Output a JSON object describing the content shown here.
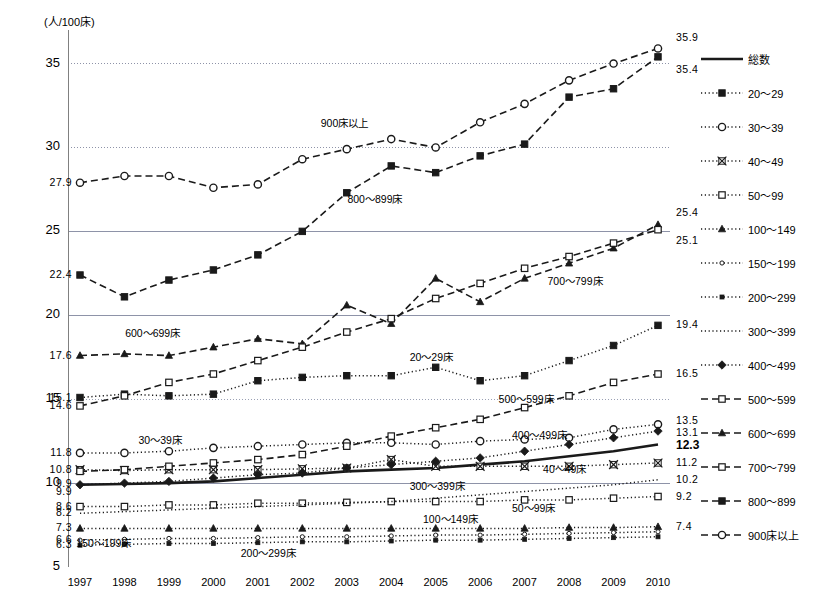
{
  "chart_data": {
    "type": "line",
    "title": "",
    "xlabel": "",
    "ylabel": "(人/100床)",
    "x": [
      "1997",
      "1998",
      "1999",
      "2000",
      "2001",
      "2002",
      "2003",
      "2004",
      "2005",
      "2006",
      "2007",
      "2008",
      "2009",
      "2010"
    ],
    "ylim": [
      5,
      37
    ],
    "yticks": [
      5,
      10,
      15,
      20,
      25,
      30,
      35
    ],
    "grid": true,
    "legend_position": "right",
    "series": [
      {
        "name": "総数",
        "style": "solid-thick",
        "marker": "none",
        "start_label": "9.9",
        "end_label": "12.3",
        "values": [
          9.9,
          9.95,
          10.0,
          10.1,
          10.3,
          10.5,
          10.7,
          10.8,
          10.9,
          11.1,
          11.3,
          11.6,
          11.9,
          12.3
        ]
      },
      {
        "name": "20〜29",
        "style": "dotted",
        "marker": "square",
        "start_label": "15.1",
        "end_label": "19.4",
        "values": [
          15.1,
          15.3,
          15.2,
          15.3,
          16.1,
          16.3,
          16.4,
          16.4,
          16.9,
          16.1,
          16.4,
          17.3,
          18.2,
          19.4
        ]
      },
      {
        "name": "30〜39",
        "style": "dotted",
        "marker": "circle-open",
        "start_label": "11.8",
        "end_label": "13.5",
        "values": [
          11.8,
          11.8,
          11.9,
          12.1,
          12.2,
          12.3,
          12.4,
          12.4,
          12.3,
          12.5,
          12.6,
          12.7,
          13.2,
          13.5
        ]
      },
      {
        "name": "40〜49",
        "style": "dotted",
        "marker": "cross-box",
        "start_label": "10.8",
        "end_label": "11.2",
        "values": [
          10.8,
          10.75,
          10.8,
          10.8,
          10.8,
          10.85,
          10.9,
          11.4,
          11.0,
          11.0,
          11.0,
          11.0,
          11.1,
          11.2
        ]
      },
      {
        "name": "50〜99",
        "style": "dotted",
        "marker": "square-open",
        "start_label": "8.6",
        "end_label": "9.2",
        "values": [
          8.6,
          8.6,
          8.7,
          8.7,
          8.8,
          8.8,
          8.85,
          8.9,
          8.9,
          8.9,
          9.0,
          9.0,
          9.1,
          9.2
        ]
      },
      {
        "name": "100〜149",
        "style": "dotted",
        "marker": "triangle",
        "start_label": "7.3",
        "end_label": "7.4",
        "values": [
          7.3,
          7.3,
          7.3,
          7.3,
          7.3,
          7.3,
          7.3,
          7.3,
          7.3,
          7.3,
          7.3,
          7.35,
          7.35,
          7.4
        ]
      },
      {
        "name": "150〜199",
        "style": "dotted",
        "marker": "circle-small",
        "start_label": "6.6",
        "end_label": "",
        "values": [
          6.6,
          6.65,
          6.7,
          6.7,
          6.75,
          6.8,
          6.8,
          6.85,
          6.9,
          6.9,
          6.95,
          7.0,
          7.05,
          7.1
        ]
      },
      {
        "name": "200〜299",
        "style": "dotted",
        "marker": "square-tiny",
        "start_label": "6.3",
        "end_label": "",
        "values": [
          6.3,
          6.35,
          6.4,
          6.4,
          6.45,
          6.5,
          6.5,
          6.55,
          6.6,
          6.6,
          6.65,
          6.7,
          6.75,
          6.8
        ]
      },
      {
        "name": "300〜399",
        "style": "dotted",
        "marker": "none",
        "start_label": "8.2",
        "end_label": "10.2",
        "values": [
          8.2,
          8.3,
          8.4,
          8.5,
          8.6,
          8.7,
          8.8,
          8.9,
          9.1,
          9.3,
          9.5,
          9.7,
          9.9,
          10.2
        ]
      },
      {
        "name": "400〜499",
        "style": "dotted",
        "marker": "diamond",
        "start_label": "9.9",
        "end_label": "13.1",
        "values": [
          9.9,
          10.0,
          10.1,
          10.3,
          10.5,
          10.6,
          10.9,
          11.1,
          11.3,
          11.5,
          11.9,
          12.3,
          12.7,
          13.1
        ]
      },
      {
        "name": "500〜599",
        "style": "dashed",
        "marker": "square-open",
        "start_label": "14.6",
        "end_label": "16.5",
        "values": [
          10.7,
          10.8,
          11.0,
          11.2,
          11.4,
          11.7,
          12.2,
          12.8,
          13.3,
          13.8,
          14.5,
          15.2,
          16.0,
          16.5
        ]
      },
      {
        "name": "600〜699",
        "style": "dashed",
        "marker": "triangle",
        "start_label": "17.6",
        "end_label": "",
        "values": [
          17.6,
          17.7,
          17.6,
          18.1,
          18.6,
          18.3,
          20.6,
          19.5,
          22.2,
          20.8,
          22.2,
          23.1,
          24.0,
          25.4
        ]
      },
      {
        "name": "700〜799",
        "style": "dashed",
        "marker": "square-open",
        "start_label": "14.6",
        "end_label": "25.1",
        "values": [
          14.6,
          15.2,
          16.0,
          16.5,
          17.3,
          18.1,
          19.0,
          19.8,
          21.0,
          21.9,
          22.8,
          23.5,
          24.3,
          25.1
        ]
      },
      {
        "name": "800〜899",
        "style": "dashed",
        "marker": "square",
        "start_label": "22.4",
        "end_label": "35.4",
        "values": [
          22.4,
          21.1,
          22.1,
          22.7,
          23.6,
          25.0,
          27.3,
          28.9,
          28.5,
          29.5,
          30.2,
          33.0,
          33.5,
          35.4
        ]
      },
      {
        "name": "900床以上",
        "style": "dashed",
        "marker": "circle-open",
        "start_label": "27.9",
        "end_label": "35.9",
        "values": [
          27.9,
          28.3,
          28.3,
          27.6,
          27.8,
          29.3,
          29.9,
          30.5,
          30.0,
          31.5,
          32.6,
          34.0,
          35.0,
          35.9
        ]
      }
    ],
    "left_value_labels": [
      {
        "text": "27.9",
        "value": 27.9
      },
      {
        "text": "22.4",
        "value": 22.4
      },
      {
        "text": "17.6",
        "value": 17.6
      },
      {
        "text": "15.1",
        "value": 15.1
      },
      {
        "text": "14.6",
        "value": 14.6
      },
      {
        "text": "11.8",
        "value": 11.8
      },
      {
        "text": "10.8",
        "value": 10.8
      },
      {
        "text": "9.9",
        "value": 9.95
      },
      {
        "text": "9.9",
        "value": 9.45
      },
      {
        "text": "8.6",
        "value": 8.6
      },
      {
        "text": "8.2",
        "value": 8.2
      },
      {
        "text": "7.3",
        "value": 7.3
      },
      {
        "text": "6.6",
        "value": 6.6
      },
      {
        "text": "6.3",
        "value": 6.3
      }
    ],
    "right_value_labels": [
      {
        "text": "35.9",
        "value": 36.5,
        "bold": false
      },
      {
        "text": "35.4",
        "value": 34.6,
        "bold": false
      },
      {
        "text": "25.4",
        "value": 26.1,
        "bold": false
      },
      {
        "text": "25.1",
        "value": 24.4,
        "bold": false
      },
      {
        "text": "19.4",
        "value": 19.4,
        "bold": false
      },
      {
        "text": "16.5",
        "value": 16.5,
        "bold": false
      },
      {
        "text": "13.5",
        "value": 13.7,
        "bold": false
      },
      {
        "text": "13.1",
        "value": 13.0,
        "bold": false
      },
      {
        "text": "12.3",
        "value": 12.2,
        "bold": true
      },
      {
        "text": "11.2",
        "value": 11.2,
        "bold": false
      },
      {
        "text": "10.2",
        "value": 10.2,
        "bold": false
      },
      {
        "text": "9.2",
        "value": 9.2,
        "bold": false
      },
      {
        "text": "7.4",
        "value": 7.4,
        "bold": false
      }
    ],
    "annotations": [
      {
        "text": "900床以上",
        "x": 2003,
        "value": 31.5
      },
      {
        "text": "800〜899床",
        "x": 2003.6,
        "value": 27.0
      },
      {
        "text": "700〜799床",
        "x": 2008.1,
        "value": 22.1
      },
      {
        "text": "600〜699床",
        "x": 1998.6,
        "value": 19.0
      },
      {
        "text": "500〜599床",
        "x": 2007.0,
        "value": 15.1
      },
      {
        "text": "20〜29床",
        "x": 2005.0,
        "value": 17.6
      },
      {
        "text": "400〜499床",
        "x": 2007.3,
        "value": 12.9
      },
      {
        "text": "40〜49床",
        "x": 2008.0,
        "value": 10.9
      },
      {
        "text": "30〜39床",
        "x": 1998.9,
        "value": 12.6
      },
      {
        "text": "300〜399床",
        "x": 2005.0,
        "value": 9.9
      },
      {
        "text": "50〜99床",
        "x": 2007.3,
        "value": 8.6
      },
      {
        "text": "100〜149床",
        "x": 2005.3,
        "value": 7.9
      },
      {
        "text": "150〜199床",
        "x": 1997.5,
        "value": 6.5
      },
      {
        "text": "200〜299床",
        "x": 2001.2,
        "value": 5.9
      }
    ]
  },
  "legend": {
    "items": [
      {
        "label": "総数",
        "style": "solid-thick",
        "marker": "none"
      },
      {
        "label": "20〜29",
        "style": "dotted",
        "marker": "square"
      },
      {
        "label": "30〜39",
        "style": "dotted",
        "marker": "circle-open"
      },
      {
        "label": "40〜49",
        "style": "dotted",
        "marker": "cross-box"
      },
      {
        "label": "50〜99",
        "style": "dotted",
        "marker": "square-open"
      },
      {
        "label": "100〜149",
        "style": "dotted",
        "marker": "triangle"
      },
      {
        "label": "150〜199",
        "style": "dotted",
        "marker": "circle-small"
      },
      {
        "label": "200〜299",
        "style": "dotted",
        "marker": "square-tiny"
      },
      {
        "label": "300〜399",
        "style": "dotted",
        "marker": "none"
      },
      {
        "label": "400〜499",
        "style": "dotted",
        "marker": "diamond"
      },
      {
        "label": "500〜599",
        "style": "dashed",
        "marker": "square-open"
      },
      {
        "label": "600〜699",
        "style": "dashed",
        "marker": "triangle"
      },
      {
        "label": "700〜799",
        "style": "dashed",
        "marker": "square-open"
      },
      {
        "label": "800〜899",
        "style": "dashed",
        "marker": "square"
      },
      {
        "label": "900床以上",
        "style": "dashed",
        "marker": "circle-open"
      }
    ]
  },
  "colors": {
    "line": "#1a1a1a",
    "grid": "#9aa0b4",
    "axis": "#808080",
    "text": "#000000",
    "background": "#ffffff"
  }
}
